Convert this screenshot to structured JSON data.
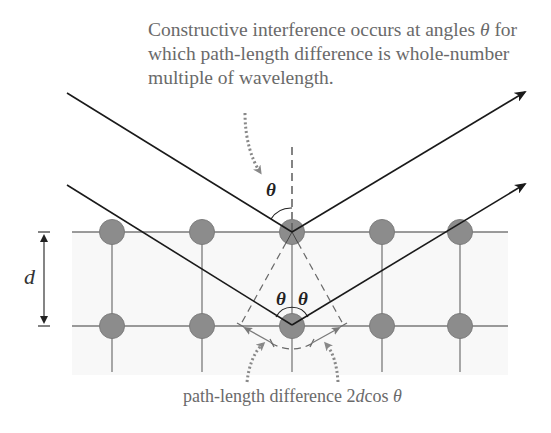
{
  "caption": {
    "line1_pre": "Constructive interference occurs at angles ",
    "theta": "θ",
    "line1_post": " for",
    "line2": "which path-length difference is whole-number",
    "line3": "multiple of wavelength."
  },
  "labels": {
    "d": "d",
    "theta_top": "θ",
    "theta_left": "θ",
    "theta_right": "θ"
  },
  "footer": {
    "prefix": "path-length difference 2",
    "d": "d",
    "cos": "cos ",
    "theta": "θ"
  },
  "lattice": {
    "columns_x": [
      112,
      202,
      292,
      382,
      460
    ],
    "rows_y": [
      232,
      326
    ],
    "atom_color": "#8c8c8c",
    "line_color": "#7a7a7a"
  },
  "colors": {
    "ray": "#1a1a1a",
    "text": "#6a6a6a",
    "dashed": "#6a6a6a",
    "band": "#f8f8f8"
  }
}
